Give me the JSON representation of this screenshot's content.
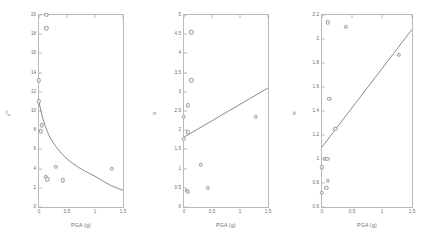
{
  "figure": {
    "title": "",
    "background": "#ffffff",
    "marker_color": "#9b9b9b",
    "marker_fill": "#f2f2f2",
    "line_color": "#3a3a4a",
    "axis_color": "#b9b9b9"
  },
  "chart_data": [
    {
      "type": "scatter",
      "title": "",
      "xlabel": "PGA (g)",
      "ylabel": "t_w",
      "ylabel_main": "t",
      "ylabel_sub": "w",
      "xlim": [
        0,
        1.5
      ],
      "ylim": [
        0,
        20
      ],
      "xticks": [
        0,
        0.5,
        1,
        1.5
      ],
      "xticklabels": [
        "0",
        "0.5",
        "1",
        "1.5"
      ],
      "yticks": [
        0,
        2,
        4,
        6,
        8,
        10,
        12,
        14,
        16,
        18,
        20
      ],
      "yticklabels": [
        "0",
        "2",
        "4",
        "6",
        "8",
        "10",
        "12",
        "14",
        "16",
        "18",
        "20"
      ],
      "grid": false,
      "legend": "none",
      "points": [
        {
          "x": 0.13,
          "y": 20.0
        },
        {
          "x": 0.13,
          "y": 18.6
        },
        {
          "x": 0.0,
          "y": 13.2
        },
        {
          "x": 0.0,
          "y": 11.0
        },
        {
          "x": 0.05,
          "y": 8.5
        },
        {
          "x": 0.03,
          "y": 7.9
        },
        {
          "x": 0.3,
          "y": 4.2
        },
        {
          "x": 1.3,
          "y": 3.95
        },
        {
          "x": 0.12,
          "y": 3.15
        },
        {
          "x": 0.15,
          "y": 2.9
        },
        {
          "x": 0.42,
          "y": 2.8
        }
      ],
      "fit_curve": {
        "description": "decaying power curve",
        "points": [
          {
            "x": 0.0,
            "y": 10.9
          },
          {
            "x": 0.05,
            "y": 9.6
          },
          {
            "x": 0.1,
            "y": 8.6
          },
          {
            "x": 0.15,
            "y": 7.85
          },
          {
            "x": 0.2,
            "y": 7.2
          },
          {
            "x": 0.3,
            "y": 6.3
          },
          {
            "x": 0.4,
            "y": 5.6
          },
          {
            "x": 0.5,
            "y": 5.0
          },
          {
            "x": 0.6,
            "y": 4.55
          },
          {
            "x": 0.7,
            "y": 4.15
          },
          {
            "x": 0.8,
            "y": 3.8
          },
          {
            "x": 0.9,
            "y": 3.5
          },
          {
            "x": 1.0,
            "y": 3.2
          },
          {
            "x": 1.1,
            "y": 2.85
          },
          {
            "x": 1.2,
            "y": 2.5
          },
          {
            "x": 1.3,
            "y": 2.2
          },
          {
            "x": 1.4,
            "y": 1.95
          },
          {
            "x": 1.5,
            "y": 1.75
          }
        ]
      }
    },
    {
      "type": "scatter",
      "title": "",
      "xlabel": "PGA (g)",
      "ylabel": "n",
      "ylabel_main": "n",
      "ylabel_sub": "",
      "xlim": [
        0,
        1.5
      ],
      "ylim": [
        0,
        5
      ],
      "xticks": [
        0,
        0.5,
        1,
        1.5
      ],
      "xticklabels": [
        "0",
        "0.5",
        "1",
        "1.5"
      ],
      "yticks": [
        0,
        0.5,
        1,
        1.5,
        2,
        2.5,
        3,
        3.5,
        4,
        4.5,
        5
      ],
      "yticklabels": [
        "0",
        "0.5",
        "1",
        "1.5",
        "2",
        "2.5",
        "3",
        "3.5",
        "4",
        "4.5",
        "5"
      ],
      "grid": false,
      "legend": "none",
      "points": [
        {
          "x": 0.13,
          "y": 4.55
        },
        {
          "x": 0.13,
          "y": 3.3
        },
        {
          "x": 0.07,
          "y": 2.65
        },
        {
          "x": 0.0,
          "y": 2.35
        },
        {
          "x": 1.28,
          "y": 2.35
        },
        {
          "x": 0.07,
          "y": 1.95
        },
        {
          "x": 0.0,
          "y": 1.78
        },
        {
          "x": 0.3,
          "y": 1.1
        },
        {
          "x": 0.42,
          "y": 0.5
        },
        {
          "x": 0.05,
          "y": 0.42
        },
        {
          "x": 0.07,
          "y": 0.4
        }
      ],
      "fit_curve": {
        "description": "rising straight line",
        "points": [
          {
            "x": 0.0,
            "y": 1.82
          },
          {
            "x": 1.5,
            "y": 3.1
          }
        ]
      }
    },
    {
      "type": "scatter",
      "title": "",
      "xlabel": "PGA (g)",
      "ylabel": "k",
      "ylabel_main": "k",
      "ylabel_sub": "",
      "xlim": [
        0,
        1.5
      ],
      "ylim": [
        0.6,
        2.2
      ],
      "xticks": [
        0,
        0.5,
        1,
        1.5
      ],
      "xticklabels": [
        "0",
        "0.5",
        "1",
        "1.5"
      ],
      "yticks": [
        0.6,
        0.8,
        1,
        1.2,
        1.4,
        1.6,
        1.8,
        2,
        2.2
      ],
      "yticklabels": [
        "0.6",
        "0.8",
        "1",
        "1.2",
        "1.4",
        "1.6",
        "1.8",
        "2",
        "2.2"
      ],
      "grid": false,
      "legend": "none",
      "points": [
        {
          "x": 0.1,
          "y": 2.14
        },
        {
          "x": 0.4,
          "y": 2.1
        },
        {
          "x": 1.28,
          "y": 1.87
        },
        {
          "x": 0.12,
          "y": 1.5
        },
        {
          "x": 0.22,
          "y": 1.25
        },
        {
          "x": 0.05,
          "y": 1.0
        },
        {
          "x": 0.09,
          "y": 1.0
        },
        {
          "x": 0.0,
          "y": 0.93
        },
        {
          "x": 0.1,
          "y": 0.82
        },
        {
          "x": 0.07,
          "y": 0.76
        },
        {
          "x": 0.0,
          "y": 0.72
        }
      ],
      "fit_curve": {
        "description": "rising straight line",
        "points": [
          {
            "x": 0.0,
            "y": 1.1
          },
          {
            "x": 1.5,
            "y": 2.08
          }
        ]
      }
    }
  ]
}
